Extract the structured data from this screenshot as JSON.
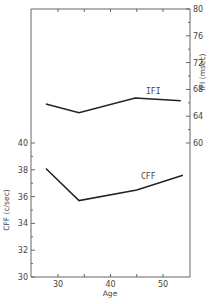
{
  "chart_data": {
    "type": "line",
    "title": "",
    "xlabel": "Age",
    "xlim": [
      25,
      55
    ],
    "x_ticks": [
      30,
      40,
      50
    ],
    "x_minor_ticks": [
      35,
      45
    ],
    "y_left": {
      "label": "CFF (c/sec)",
      "lim": [
        30,
        40
      ],
      "ticks": [
        30,
        32,
        34,
        36,
        38,
        40
      ]
    },
    "y_right": {
      "label": "IFI (msec)",
      "lim": [
        60,
        80
      ],
      "ticks": [
        60,
        64,
        68,
        72,
        76,
        80
      ]
    },
    "series": [
      {
        "name": "IFI",
        "axis": "right",
        "x": [
          27.7,
          34.0,
          44.7,
          53.4
        ],
        "values": [
          65.8,
          64.5,
          66.7,
          66.3
        ]
      },
      {
        "name": "CFF",
        "axis": "left",
        "x": [
          27.7,
          34.0,
          45.0,
          53.8
        ],
        "values": [
          38.1,
          35.7,
          36.5,
          37.6
        ]
      }
    ],
    "grid": false,
    "legend": "inline labels"
  }
}
